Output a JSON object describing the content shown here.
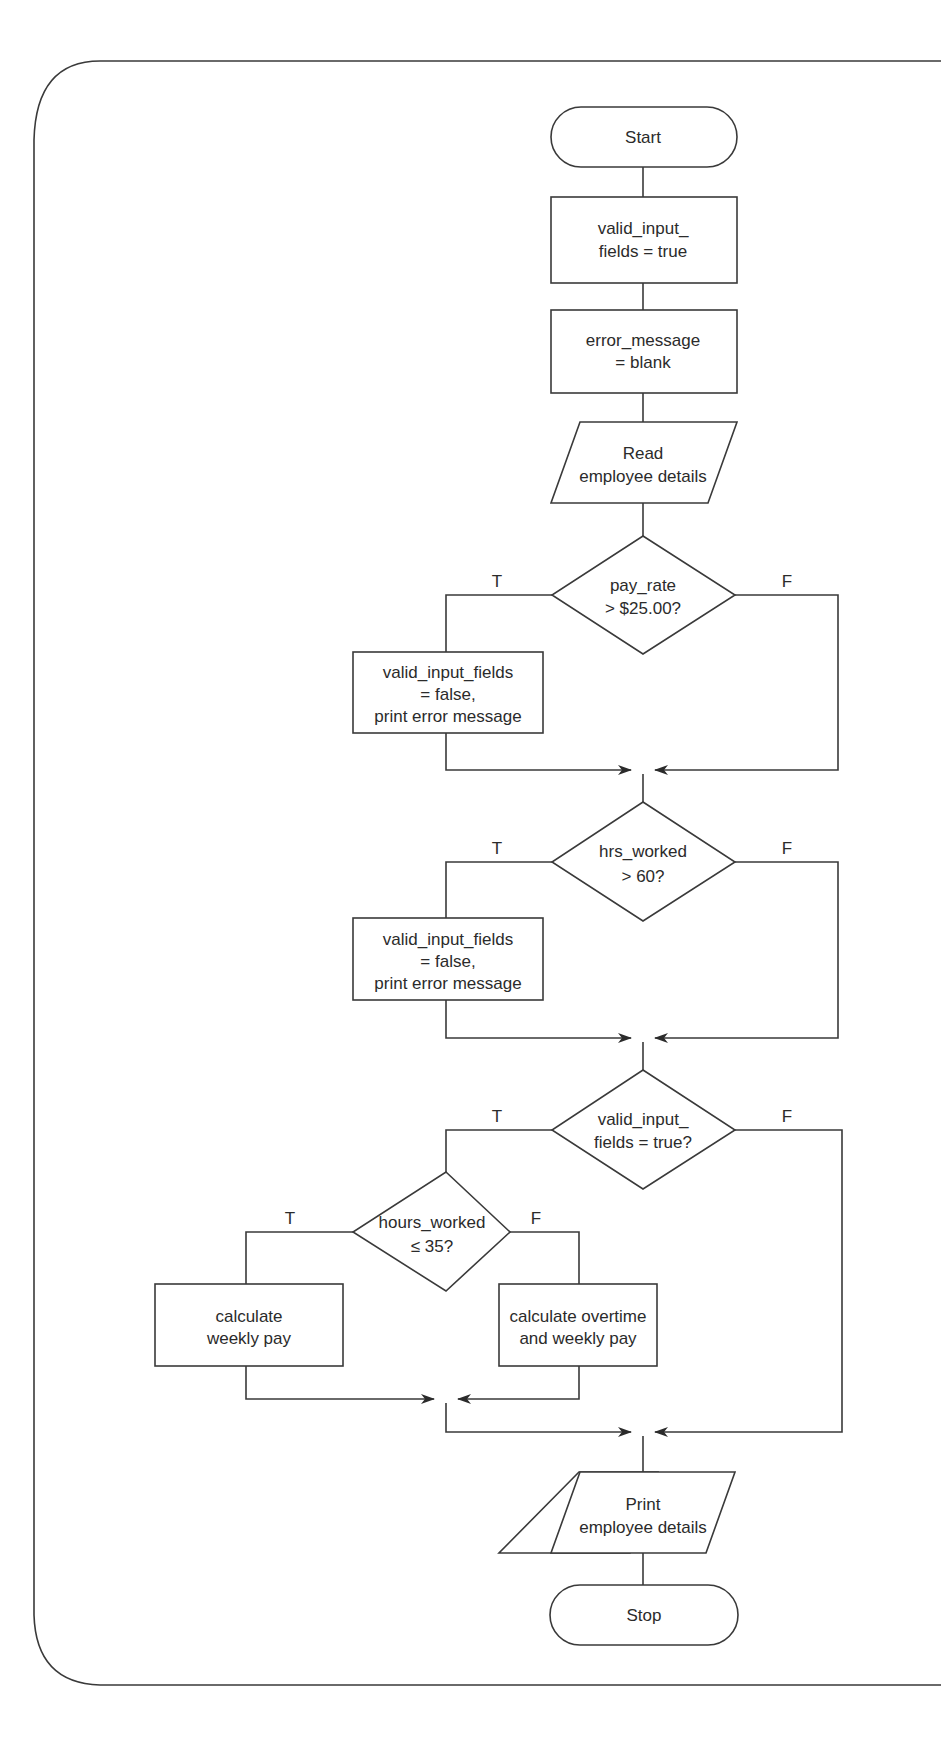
{
  "diagram": {
    "type": "flowchart",
    "nodes": {
      "start": {
        "shape": "terminator",
        "lines": [
          "Start"
        ]
      },
      "init_valid": {
        "shape": "process",
        "lines": [
          "valid_input_",
          "fields = true"
        ]
      },
      "init_error": {
        "shape": "process",
        "lines": [
          "error_message",
          "= blank"
        ]
      },
      "read_details": {
        "shape": "input-output",
        "lines": [
          "Read",
          "employee details"
        ]
      },
      "check_pay_rate": {
        "shape": "decision",
        "lines": [
          "pay_rate",
          "> $25.00?"
        ]
      },
      "pay_rate_error": {
        "shape": "process",
        "lines": [
          "valid_input_fields",
          "= false,",
          "print error message"
        ]
      },
      "check_hrs_worked": {
        "shape": "decision",
        "lines": [
          "hrs_worked",
          "> 60?"
        ]
      },
      "hrs_error": {
        "shape": "process",
        "lines": [
          "valid_input_fields",
          "= false,",
          "print error message"
        ]
      },
      "check_valid": {
        "shape": "decision",
        "lines": [
          "valid_input_",
          "fields = true?"
        ]
      },
      "check_hours_35": {
        "shape": "decision",
        "lines": [
          "hours_worked",
          "≤ 35?"
        ]
      },
      "calc_weekly": {
        "shape": "process",
        "lines": [
          "calculate",
          "weekly pay"
        ]
      },
      "calc_overtime": {
        "shape": "process",
        "lines": [
          "calculate overtime",
          "and weekly pay"
        ]
      },
      "print_details": {
        "shape": "input-output",
        "lines": [
          "Print",
          "employee details"
        ]
      },
      "stop": {
        "shape": "terminator",
        "lines": [
          "Stop"
        ]
      }
    },
    "branch_labels": {
      "true": "T",
      "false": "F"
    },
    "edges": [
      {
        "from": "start",
        "to": "init_valid"
      },
      {
        "from": "init_valid",
        "to": "init_error"
      },
      {
        "from": "init_error",
        "to": "read_details"
      },
      {
        "from": "read_details",
        "to": "check_pay_rate"
      },
      {
        "from": "check_pay_rate",
        "to": "pay_rate_error",
        "label": "T"
      },
      {
        "from": "check_pay_rate",
        "to": "check_hrs_worked",
        "label": "F"
      },
      {
        "from": "pay_rate_error",
        "to": "check_hrs_worked"
      },
      {
        "from": "check_hrs_worked",
        "to": "hrs_error",
        "label": "T"
      },
      {
        "from": "check_hrs_worked",
        "to": "check_valid",
        "label": "F"
      },
      {
        "from": "hrs_error",
        "to": "check_valid"
      },
      {
        "from": "check_valid",
        "to": "check_hours_35",
        "label": "T"
      },
      {
        "from": "check_valid",
        "to": "print_details",
        "label": "F"
      },
      {
        "from": "check_hours_35",
        "to": "calc_weekly",
        "label": "T"
      },
      {
        "from": "check_hours_35",
        "to": "calc_overtime",
        "label": "F"
      },
      {
        "from": "calc_weekly",
        "to": "print_details"
      },
      {
        "from": "calc_overtime",
        "to": "print_details"
      },
      {
        "from": "print_details",
        "to": "stop"
      }
    ]
  }
}
